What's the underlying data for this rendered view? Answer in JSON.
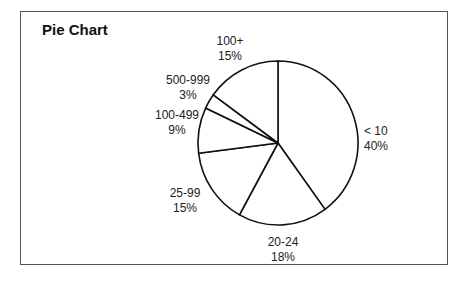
{
  "chart_data": {
    "type": "pie",
    "title": "Pie Chart",
    "categories": [
      "< 10",
      "20-24",
      "25-99",
      "100-499",
      "500-999",
      "100+"
    ],
    "values": [
      40,
      18,
      15,
      9,
      3,
      15
    ],
    "labels": [
      {
        "name": "< 10",
        "pct": "40%"
      },
      {
        "name": "20-24",
        "pct": "18%"
      },
      {
        "name": "25-99",
        "pct": "15%"
      },
      {
        "name": "100-499",
        "pct": "9%"
      },
      {
        "name": "500-999",
        "pct": "3%"
      },
      {
        "name": "100+",
        "pct": "15%"
      }
    ],
    "start_angle": "12 o'clock, clockwise",
    "legend": "none (direct labels)",
    "fill": "#ffffff",
    "stroke": "#111111"
  }
}
